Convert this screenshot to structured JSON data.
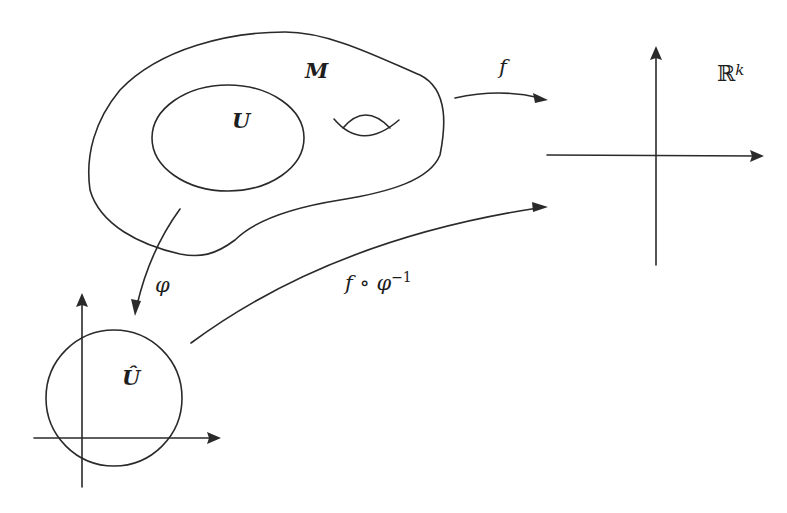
{
  "diagram": {
    "type": "manifold-chart-diagram",
    "stroke_color": "#2a2a2a",
    "background": "#ffffff",
    "labels": {
      "manifold": "M",
      "open_set": "U",
      "image_set": "Û",
      "map_f": "f",
      "chart_map": "φ",
      "composite_base": "f ∘ φ",
      "composite_exp": "−1",
      "target_space": "ℝ",
      "target_exp": "k"
    },
    "nodes": [
      {
        "id": "M",
        "desc": "manifold blob with handle"
      },
      {
        "id": "U",
        "desc": "open subset ellipse inside M"
      },
      {
        "id": "U_hat",
        "desc": "image disk in local coordinate plane"
      },
      {
        "id": "Rk",
        "desc": "target Euclidean space axes"
      }
    ],
    "edges": [
      {
        "from": "M",
        "to": "Rk",
        "label": "f"
      },
      {
        "from": "U",
        "to": "U_hat",
        "label": "φ"
      },
      {
        "from": "U_hat",
        "to": "Rk",
        "label": "f ∘ φ^−1"
      }
    ]
  }
}
